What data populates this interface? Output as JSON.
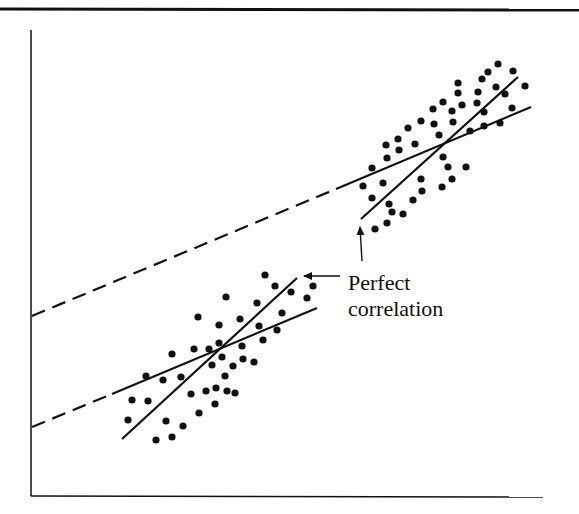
{
  "figure": {
    "annotation": {
      "line1": "Perfect",
      "line2": "correlation"
    },
    "colors": {
      "ink": "#111111",
      "background": "#ffffff"
    }
  },
  "chart_data": {
    "type": "scatter",
    "title": "",
    "xlabel": "",
    "ylabel": "",
    "grid": false,
    "annotation": "Perfect correlation",
    "series": [
      {
        "name": "lower-cluster",
        "points_px": [
          [
            198,
            317
          ],
          [
            219,
            325
          ],
          [
            172,
            354
          ],
          [
            194,
            349
          ],
          [
            209,
            349
          ],
          [
            219,
            343
          ],
          [
            146,
            376
          ],
          [
            163,
            380
          ],
          [
            181,
            377
          ],
          [
            212,
            365
          ],
          [
            132,
            400
          ],
          [
            148,
            401
          ],
          [
            191,
            394
          ],
          [
            206,
            391
          ],
          [
            216,
            388
          ],
          [
            215,
            404
          ],
          [
            128,
            420
          ],
          [
            166,
            421
          ],
          [
            199,
            413
          ],
          [
            183,
            426
          ],
          [
            156,
            440
          ],
          [
            172,
            437
          ],
          [
            265,
            275
          ],
          [
            275,
            286
          ],
          [
            313,
            286
          ],
          [
            226,
            297
          ],
          [
            257,
            303
          ],
          [
            291,
            292
          ],
          [
            307,
            298
          ],
          [
            240,
            319
          ],
          [
            259,
            326
          ],
          [
            282,
            313
          ],
          [
            277,
            330
          ],
          [
            263,
            340
          ],
          [
            242,
            346
          ],
          [
            222,
            357
          ],
          [
            243,
            359
          ],
          [
            254,
            362
          ],
          [
            233,
            366
          ],
          [
            225,
            376
          ],
          [
            227,
            391
          ],
          [
            235,
            393
          ]
        ],
        "regression_shallow": [
          [
            112,
            394
          ],
          [
            317,
            308
          ]
        ],
        "regression_steep": [
          [
            122,
            439
          ],
          [
            297,
            278
          ]
        ]
      },
      {
        "name": "upper-cluster",
        "points_px": [
          [
            498,
            64
          ],
          [
            488,
            72
          ],
          [
            513,
            71
          ],
          [
            482,
            79
          ],
          [
            458,
            83
          ],
          [
            496,
            87
          ],
          [
            525,
            86
          ],
          [
            458,
            93
          ],
          [
            478,
            92
          ],
          [
            505,
            94
          ],
          [
            443,
            102
          ],
          [
            462,
            105
          ],
          [
            477,
            103
          ],
          [
            452,
            111
          ],
          [
            484,
            112
          ],
          [
            512,
            108
          ],
          [
            453,
            122
          ],
          [
            500,
            123
          ],
          [
            484,
            126
          ],
          [
            470,
            131
          ],
          [
            433,
            109
          ],
          [
            421,
            121
          ],
          [
            434,
            124
          ],
          [
            408,
            128
          ],
          [
            439,
            135
          ],
          [
            398,
            139
          ],
          [
            386,
            145
          ],
          [
            415,
            144
          ],
          [
            399,
            150
          ],
          [
            387,
            158
          ],
          [
            372,
            168
          ],
          [
            443,
            157
          ],
          [
            448,
            167
          ],
          [
            466,
            167
          ],
          [
            363,
            186
          ],
          [
            383,
            183
          ],
          [
            421,
            179
          ],
          [
            452,
            179
          ],
          [
            422,
            191
          ],
          [
            442,
            187
          ],
          [
            372,
            198
          ],
          [
            413,
            200
          ],
          [
            389,
            204
          ],
          [
            392,
            212
          ],
          [
            403,
            214
          ],
          [
            387,
            223
          ],
          [
            375,
            229
          ]
        ],
        "regression_shallow": [
          [
            336,
            189
          ],
          [
            531,
            107
          ]
        ],
        "regression_steep": [
          [
            361,
            219
          ],
          [
            518,
            77
          ]
        ]
      }
    ],
    "extrapolations_dashed": [
      [
        [
          32,
          316
        ],
        [
          336,
          189
        ]
      ],
      [
        [
          32,
          427
        ],
        [
          112,
          394
        ]
      ]
    ],
    "arrows": [
      {
        "from": [
          362,
          261
        ],
        "to": [
          360,
          227
        ]
      },
      {
        "from": [
          340,
          276
        ],
        "to": [
          304,
          276
        ]
      }
    ],
    "axes_px": {
      "origin": [
        31,
        496
      ],
      "x_end": 543,
      "y_top": 30
    }
  }
}
